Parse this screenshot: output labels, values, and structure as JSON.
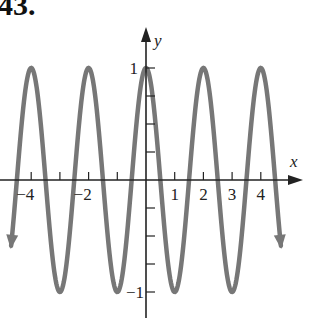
{
  "problem": {
    "number": "43."
  },
  "chart_data": {
    "type": "line",
    "title": "",
    "function": "y = cos(pi x)",
    "xlabel": "x",
    "ylabel": "y",
    "xlim": [
      -4.8,
      5.3
    ],
    "ylim": [
      -1.3,
      1.35
    ],
    "x_tick_labels": [
      "-4",
      "-2",
      "1",
      "2",
      "3",
      "4"
    ],
    "x_ticks": [
      -4,
      -3,
      -2,
      -1,
      1,
      2,
      3,
      4
    ],
    "y_tick_labels": [
      "1",
      "-1"
    ],
    "y_ticks": [
      -1,
      -0.75,
      -0.5,
      -0.25,
      0.25,
      0.5,
      0.75,
      1
    ],
    "series": [
      {
        "name": "cos(pi x)",
        "color": "#777777",
        "x": [
          -4.7,
          -4,
          -3,
          -2,
          -1,
          0,
          1,
          2,
          3,
          4,
          4.7
        ],
        "values": [
          -0.59,
          1,
          -1,
          1,
          -1,
          1,
          -1,
          1,
          -1,
          1,
          -0.59
        ]
      }
    ],
    "grid": false,
    "arrows": "curve continues beyond both ends (downward arrows)"
  }
}
